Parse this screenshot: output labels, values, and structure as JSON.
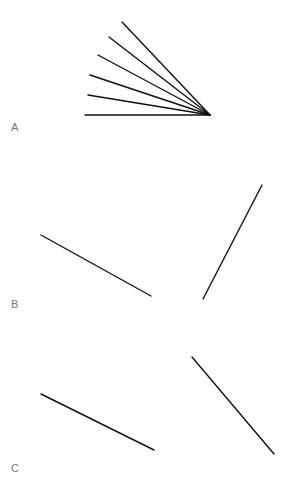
{
  "panels": [
    {
      "label": "A",
      "label_pos": [
        11,
        121
      ],
      "lines": [
        {
          "x1": 122,
          "y1": 22,
          "x2": 210,
          "y2": 115
        },
        {
          "x1": 109,
          "y1": 37,
          "x2": 210,
          "y2": 115
        },
        {
          "x1": 98,
          "y1": 55,
          "x2": 210,
          "y2": 115
        },
        {
          "x1": 90,
          "y1": 75,
          "x2": 210,
          "y2": 115
        },
        {
          "x1": 88,
          "y1": 95,
          "x2": 210,
          "y2": 115
        },
        {
          "x1": 85,
          "y1": 115,
          "x2": 210,
          "y2": 115
        }
      ]
    },
    {
      "label": "B",
      "label_pos": [
        11,
        298
      ],
      "lines": [
        {
          "x1": 41,
          "y1": 235,
          "x2": 151,
          "y2": 296
        },
        {
          "x1": 203,
          "y1": 299,
          "x2": 262,
          "y2": 185
        }
      ]
    },
    {
      "label": "C",
      "label_pos": [
        11,
        462
      ],
      "lines": [
        {
          "x1": 41,
          "y1": 394,
          "x2": 154,
          "y2": 450
        },
        {
          "x1": 192,
          "y1": 357,
          "x2": 274,
          "y2": 454
        }
      ]
    }
  ],
  "colors": {
    "line": "#111111",
    "label": "#777777",
    "background": "#ffffff"
  }
}
